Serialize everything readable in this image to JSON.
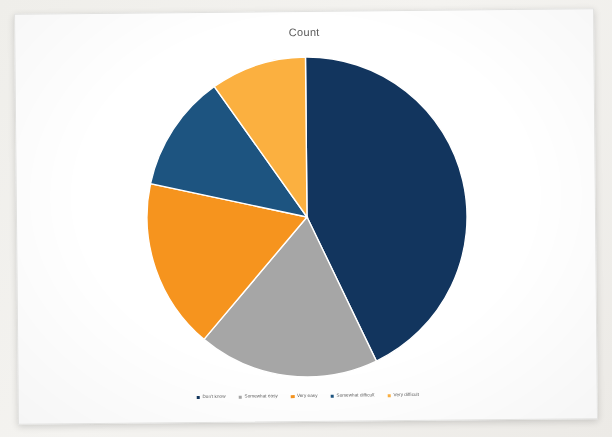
{
  "card": {
    "background": "#ffffff",
    "page_background": "#f1f0ed"
  },
  "chart_data": {
    "type": "pie",
    "title": "Count",
    "xlabel": "",
    "ylabel": "",
    "legend_position": "bottom",
    "grid": false,
    "start_angle_deg": 0,
    "direction": "clockwise",
    "categories": [
      "Don't know",
      "Somewhat easy",
      "Very easy",
      "Somewhat difficult",
      "Very difficult"
    ],
    "values": [
      40,
      17,
      16,
      11,
      9
    ],
    "percentages": [
      "40%",
      "17%",
      "16%",
      "11%",
      "9%"
    ],
    "colors": [
      "#12355e",
      "#a6a6a6",
      "#f6941e",
      "#1d5480",
      "#fbb040"
    ],
    "slices": [
      {
        "label": "Don't know",
        "value": 40,
        "color": "#12355e",
        "start_deg": 0,
        "end_deg": 144.0
      },
      {
        "label": "Somewhat easy",
        "value": 17,
        "color": "#a6a6a6",
        "start_deg": 144.0,
        "end_deg": 205.2
      },
      {
        "label": "Very easy",
        "value": 16,
        "color": "#f6941e",
        "start_deg": 205.2,
        "end_deg": 262.8
      },
      {
        "label": "Somewhat difficult",
        "value": 11,
        "color": "#1d5480",
        "start_deg": 262.8,
        "end_deg": 302.4
      },
      {
        "label": "Very difficult",
        "value": 9,
        "color": "#fbb040",
        "start_deg": 302.4,
        "end_deg": 360.0
      }
    ],
    "geometry": {
      "center_x": 290,
      "center_y": 205,
      "radius": 160
    }
  },
  "legend": {
    "items": [
      {
        "label": "Don't know",
        "color": "#12355e"
      },
      {
        "label": "Somewhat easy",
        "color": "#a6a6a6"
      },
      {
        "label": "Very easy",
        "color": "#f6941e"
      },
      {
        "label": "Somewhat difficult",
        "color": "#1d5480"
      },
      {
        "label": "Very difficult",
        "color": "#fbb040"
      }
    ]
  }
}
